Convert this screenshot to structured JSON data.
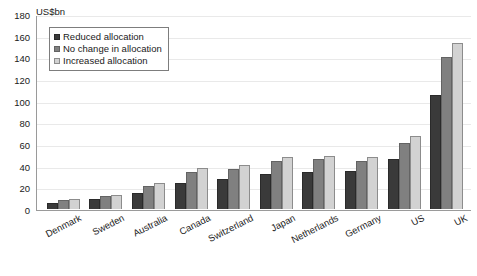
{
  "chart_data": {
    "type": "bar",
    "title": "",
    "subtitle": "",
    "unit_label": "US$bn",
    "xlabel": "",
    "ylabel": "US$bn",
    "ylim": [
      0,
      180
    ],
    "ytick_step": 20,
    "yticks": [
      180,
      160,
      140,
      120,
      100,
      80,
      60,
      40,
      20,
      0
    ],
    "grid": true,
    "legend_position": "top-left-inside",
    "categories": [
      "Denmark",
      "Sweden",
      "Australia",
      "Canada",
      "Switzerland",
      "Japan",
      "Netherlands",
      "Germany",
      "US",
      "UK"
    ],
    "series": [
      {
        "name": "Reduced allocation",
        "color": "#3a3a3a",
        "values": [
          6,
          9,
          15,
          24,
          28,
          32,
          34,
          35,
          46,
          105
        ]
      },
      {
        "name": "No change in allocation",
        "color": "#808080",
        "values": [
          8,
          12,
          21,
          34,
          37,
          44,
          46,
          44,
          61,
          140
        ]
      },
      {
        "name": "Increased allocation",
        "color": "#d2d2d2",
        "values": [
          9,
          13,
          24,
          38,
          41,
          48,
          49,
          48,
          67,
          153
        ]
      }
    ]
  }
}
